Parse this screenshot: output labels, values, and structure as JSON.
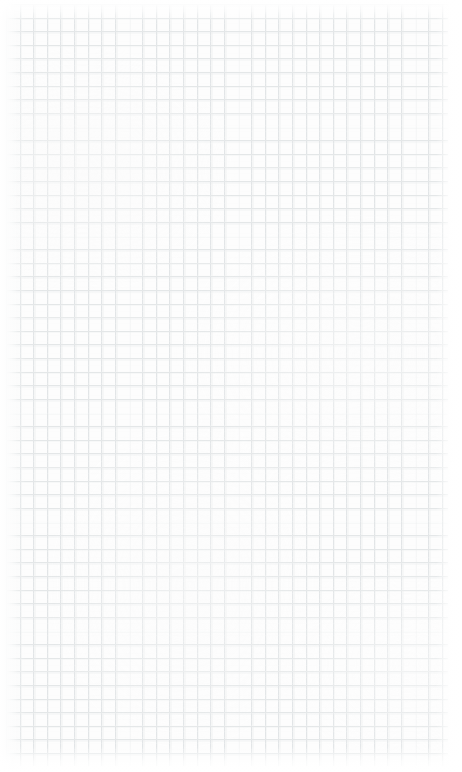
{
  "document": {
    "kind": "scanned-graph-paper",
    "description": "Blank sheet of squared graph paper, scanned",
    "orientation": "portrait",
    "width_px": 462,
    "height_px": 772,
    "has_writing": false,
    "marks": []
  },
  "paper": {
    "base_color": "#fdfdfd",
    "background_color": "#ffffff"
  },
  "grid": {
    "style": "square",
    "cell_size_px": 13.62,
    "line_color_vertical": "#e2e5e7",
    "line_color_horizontal": "#e4e7e8",
    "line_width_px": 0.9,
    "has_major_lines": false,
    "extent": {
      "left_px": 6,
      "top_px": 4,
      "right_px": 448,
      "bottom_px": 766
    },
    "columns": 32,
    "rows": 56
  },
  "margins": {
    "top_px": 4,
    "bottom_px": 6,
    "left_px": 6,
    "right_px": 14,
    "fade": "white, soft"
  },
  "scan_artifacts": {
    "mottling": true,
    "horizontal_banding": true,
    "left_edge_shading": true,
    "line_ghosting": true
  }
}
